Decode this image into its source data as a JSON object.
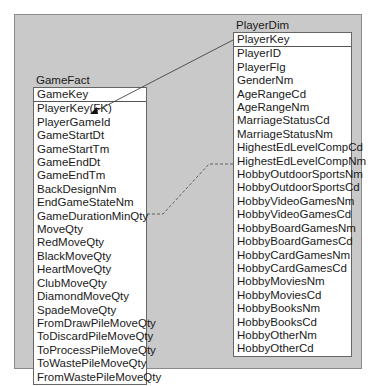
{
  "diagram": {
    "tables": {
      "player_dim": {
        "name": "PlayerDim",
        "key": "PlayerKey",
        "columns": [
          "PlayerID",
          "PlayerFlg",
          "GenderNm",
          "AgeRangeCd",
          "AgeRangeNm",
          "MarriageStatusCd",
          "MarriageStatusNm",
          "HighestEdLevelCompCd",
          "HighestEdLevelCompNm",
          "HobbyOutdoorSportsNm",
          "HobbyOutdoorSportsCd",
          "HobbyVideoGamesNm",
          "HobbyVideoGamesCd",
          "HobbyBoardGamesNm",
          "HobbyBoardGamesCd",
          "HobbyCardGamesNm",
          "HobbyCardGamesCd",
          "HobbyMoviesNm",
          "HobbyMoviesCd",
          "HobbyBooksNm",
          "HobbyBooksCd",
          "HobbyOtherNm",
          "HobbyOtherCd"
        ]
      },
      "game_fact": {
        "name": "GameFact",
        "key": "GameKey",
        "columns": [
          "PlayerKey(FK)",
          "PlayerGameId",
          "GameStartDt",
          "GameStartTm",
          "GameEndDt",
          "GameEndTm",
          "BackDesignNm",
          "EndGameStateNm",
          "GameDurationMinQty",
          "MoveQty",
          "RedMoveQty",
          "BlackMoveQty",
          "HeartMoveQty",
          "ClubMoveQty",
          "DiamondMoveQty",
          "SpadeMoveQty",
          "FromDrawPileMoveQty",
          "ToDiscardPileMoveQty",
          "ToProcessPileMoveQty",
          "ToWastePileMoveQty",
          "FromWastePileMoveQty"
        ]
      }
    },
    "relationships": [
      {
        "from": "PlayerDim.PlayerKey",
        "to": "GameFact.PlayerKey(FK)",
        "style": "solid-arrow"
      },
      {
        "from": "GameFact.MoveQty",
        "to": "PlayerDim.HobbyOutdoorSportsNm",
        "style": "dashed"
      }
    ],
    "colors": {
      "background": "#c9c9c9",
      "frame_border": "#8a8a8a",
      "table_bg": "#ffffff",
      "line": "#444444"
    }
  }
}
